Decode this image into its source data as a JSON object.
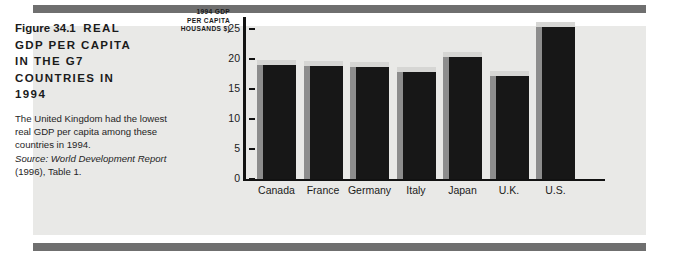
{
  "figure": {
    "label": "Figure 34.1",
    "title_line_1": "REAL",
    "title_line_2": "GDP PER CAPITA",
    "title_line_3": "IN THE G7",
    "title_line_4": "COUNTRIES IN",
    "title_line_5": "1994",
    "description": "The United Kingdom had the lowest real GDP per capita among these countries in 1994.",
    "source_label": "Source:",
    "source_title": "World Development Report",
    "source_detail": "(1996), Table 1.",
    "panel_color": "#e9e9e7",
    "rule_color": "#6f6f6f"
  },
  "chart_data": {
    "type": "bar",
    "ylabel_line_1": "1994 GDP",
    "ylabel_line_2": "PER CAPITA",
    "ylabel_line_3": "HOUSANDS $)",
    "xlabel": "",
    "categories": [
      "Canada",
      "France",
      "Germany",
      "Italy",
      "Japan",
      "U.K.",
      "U.S."
    ],
    "values": [
      19.8,
      19.6,
      19.5,
      18.7,
      21.2,
      18.0,
      26.2
    ],
    "ylim": [
      0,
      25
    ],
    "yticks": [
      25,
      20,
      15,
      10,
      5,
      0
    ],
    "ytick_labels": [
      "25",
      "20",
      "15",
      "10",
      "5",
      "0"
    ],
    "grid": false,
    "legend": false,
    "bar_face_color": "#171717",
    "bar_side_color": "#8d8d8d",
    "bar_top_color": "#d6d6d4",
    "axis_color": "#121212"
  }
}
